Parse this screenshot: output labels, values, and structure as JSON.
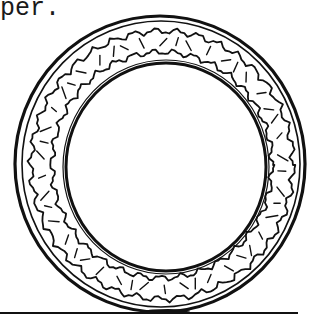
{
  "caption": {
    "text": "per."
  },
  "illustration": {
    "subject": "tire-on-ground",
    "description": "Line drawing of a tire (outer tread ring with wavy inner bands and hatch marks, inner rim circle) resting on a ground line",
    "ink_color": "#111111",
    "background_color": "#ffffff"
  }
}
